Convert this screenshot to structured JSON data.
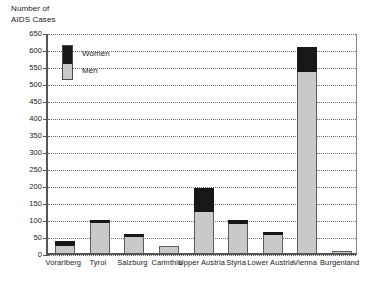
{
  "chart_data": {
    "type": "bar",
    "title": "Number of\nAIDS Cases",
    "xlabel": "",
    "ylabel": "Number of AIDS Cases",
    "ylim": [
      0,
      650
    ],
    "ytick_step": 50,
    "yticks": [
      0,
      50,
      100,
      150,
      200,
      250,
      300,
      350,
      400,
      450,
      500,
      550,
      600,
      650
    ],
    "ytick_labels": [
      "0",
      "50",
      "100",
      "150",
      "200",
      "250",
      "300",
      "350",
      "400",
      "450",
      "500",
      "550",
      "600",
      "650"
    ],
    "grid": true,
    "stacked": true,
    "legend_position": "inside-top-left",
    "categories": [
      "Vorarlberg",
      "Tyrol",
      "Salzburg",
      "Carinthia",
      "Upper Austria",
      "Styria",
      "Lower Austria",
      "Vienna",
      "Burgenland"
    ],
    "series": [
      {
        "name": "Men",
        "color": "#c9c9c9",
        "values": [
          25,
          90,
          50,
          20,
          125,
          88,
          57,
          535,
          7
        ]
      },
      {
        "name": "Women",
        "color": "#17171a",
        "values": [
          10,
          7,
          5,
          0,
          65,
          8,
          5,
          70,
          0
        ]
      }
    ],
    "totals": [
      35,
      97,
      55,
      20,
      190,
      96,
      62,
      605,
      7
    ]
  },
  "legend": {
    "women_label": "Women",
    "men_label": "Men"
  }
}
